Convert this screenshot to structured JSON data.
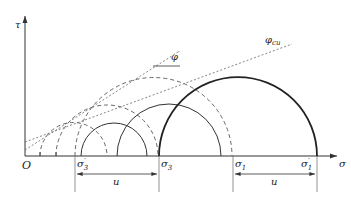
{
  "diagram": {
    "type": "mohr-circles",
    "axes": {
      "y_label": "τ",
      "x_label": "σ",
      "origin_label": "O"
    },
    "points": {
      "sigma3_prime": {
        "label": "σ",
        "sub": "3",
        "sup": "′"
      },
      "sigma3": {
        "label": "σ",
        "sub": "3"
      },
      "sigma1": {
        "label": "σ",
        "sub": "1"
      },
      "sigma1_prime": {
        "label": "σ",
        "sub": "1",
        "sup": "′"
      }
    },
    "envelopes": {
      "effective": {
        "label": "φ",
        "sup": "′"
      },
      "undrained": {
        "label": "φ",
        "sub": "cu"
      }
    },
    "dimensions": [
      {
        "label": "u"
      },
      {
        "label": "u"
      }
    ],
    "colors": {
      "line": "#333333",
      "dashed": "#666666"
    }
  }
}
